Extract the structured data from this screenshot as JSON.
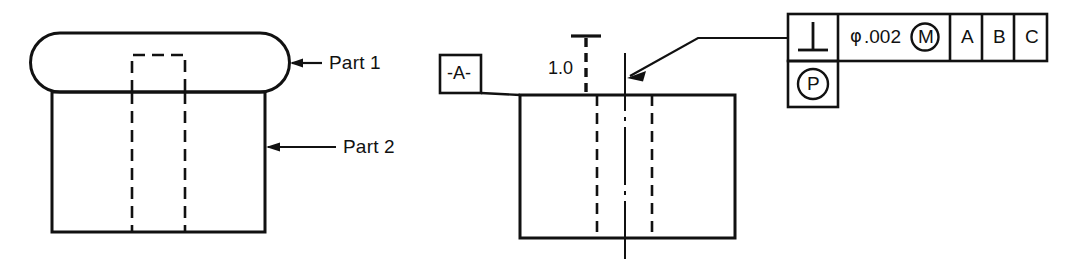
{
  "figure": {
    "background_color": "#ffffff",
    "line_color": "#111111"
  },
  "left_view": {
    "name": "assembly-section-view",
    "part1_label": "Part 1",
    "part2_label": "Part 2",
    "part1_shape": "rounded-rectangle",
    "part2_shape": "rectangle",
    "hidden_line_style": "dashed"
  },
  "right_view": {
    "name": "datum-feature-view",
    "datum_label": "-A-",
    "dimension_label": "1.0",
    "dimension_type": "projected-zone-height",
    "body_shape": "rectangle",
    "hidden_line_style": "dashed",
    "centerline_style": "dash-dot"
  },
  "feature_control_frame": {
    "name": "feature-control-frame",
    "geometric_characteristic_symbol": "perpendicularity",
    "geometric_characteristic_glyph": "⊥",
    "tolerance": {
      "diameter_symbol": "φ",
      "value": ".002",
      "material_condition": "M",
      "material_condition_meaning": "maximum-material-condition"
    },
    "datum_references": [
      "A",
      "B",
      "C"
    ],
    "projected_tolerance_zone": {
      "symbol": "P",
      "meaning": "projected-tolerance-zone"
    },
    "leader": "leader-line-to-feature"
  }
}
